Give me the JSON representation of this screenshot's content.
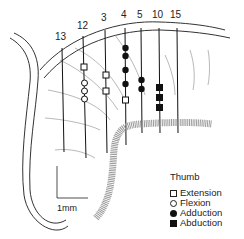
{
  "figure": {
    "track_labels": [
      "13",
      "12",
      "3",
      "4",
      "5",
      "10",
      "15"
    ],
    "scale_bar_label": "1mm",
    "legend": {
      "title": "Thumb",
      "items": [
        {
          "symbol": "open-square",
          "label": "Extension"
        },
        {
          "symbol": "open-circle",
          "label": "Flexion"
        },
        {
          "symbol": "filled-circle",
          "label": "Adduction"
        },
        {
          "symbol": "filled-square",
          "label": "Abduction"
        }
      ]
    }
  }
}
